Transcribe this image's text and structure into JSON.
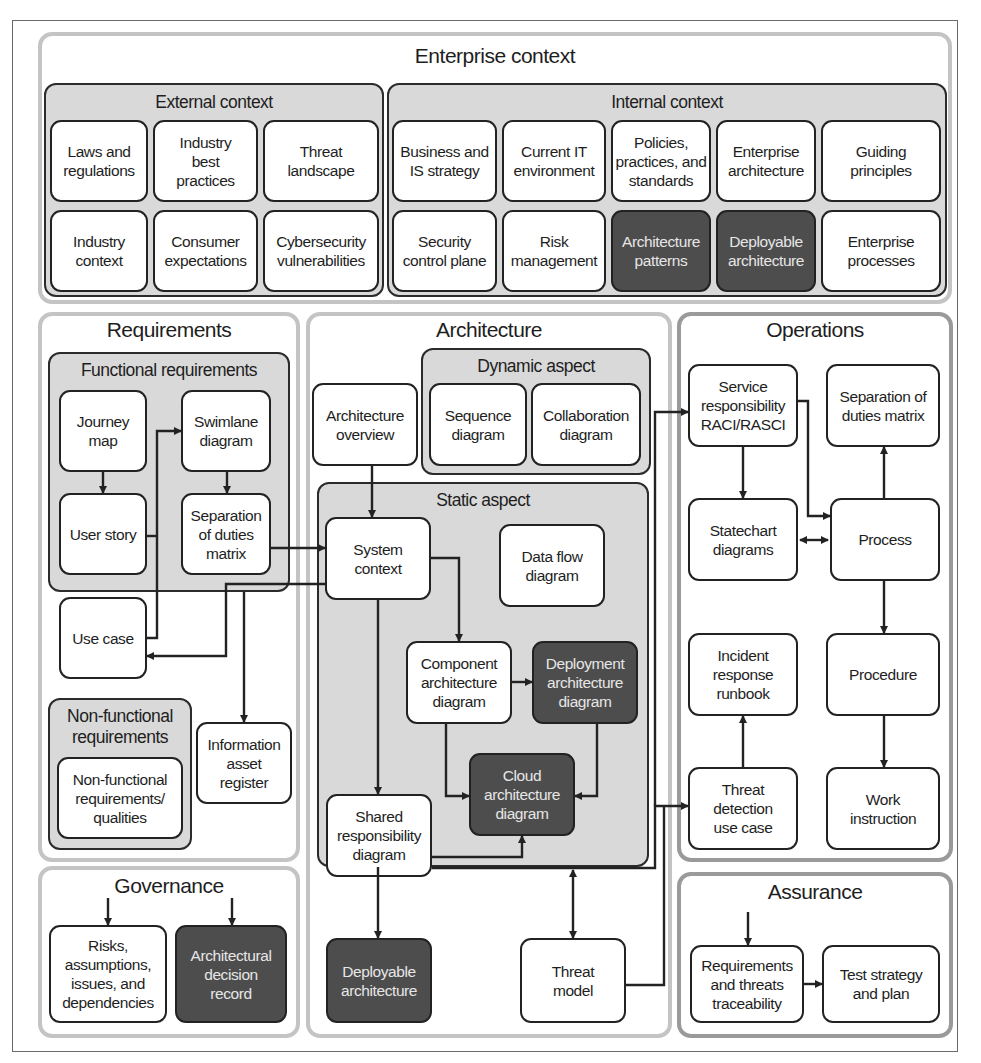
{
  "enterprise_context": {
    "title": "Enterprise context",
    "external": {
      "title": "External context",
      "items": [
        "Laws and\nregulations",
        "Industry\nbest\npractices",
        "Threat\nlandscape",
        "Industry\ncontext",
        "Consumer\nexpectations",
        "Cybersecurity\nvulnerabilities"
      ]
    },
    "internal": {
      "title": "Internal context",
      "items": [
        "Business and\nIS strategy",
        "Current IT\nenvironment",
        "Policies,\npractices, and\nstandards",
        "Enterprise\narchitecture",
        "Guiding\nprinciples",
        "Security\ncontrol plane",
        "Risk\nmanagement",
        "Architecture\npatterns",
        "Deployable\narchitecture",
        "Enterprise\nprocesses"
      ]
    }
  },
  "requirements": {
    "title": "Requirements",
    "functional": {
      "title": "Functional requirements",
      "journey_map": "Journey\nmap",
      "user_story": "User story",
      "use_case": "Use case",
      "swimlane": "Swimlane\ndiagram",
      "sod_matrix": "Separation\nof duties\nmatrix"
    },
    "non_functional": {
      "title": "Non-functional\nrequirements",
      "item": "Non-functional\nrequirements/\nqualities"
    },
    "info_asset_register": "Information\nasset\nregister"
  },
  "governance": {
    "title": "Governance",
    "raid": "Risks,\nassumptions,\nissues, and\ndependencies",
    "adr": "Architectural\ndecision\nrecord"
  },
  "architecture": {
    "title": "Architecture",
    "overview": "Architecture\noverview",
    "dynamic": {
      "title": "Dynamic aspect",
      "sequence": "Sequence\ndiagram",
      "collaboration": "Collaboration\ndiagram"
    },
    "static": {
      "title": "Static aspect",
      "system_context": "System\ncontext",
      "data_flow": "Data flow\ndiagram",
      "component": "Component\narchitecture\ndiagram",
      "deployment": "Deployment\narchitecture\ndiagram",
      "cloud": "Cloud\narchitecture\ndiagram",
      "shared_responsibility": "Shared\nresponsibility\ndiagram"
    },
    "deployable": "Deployable\narchitecture",
    "threat_model": "Threat\nmodel"
  },
  "operations": {
    "title": "Operations",
    "raci": "Service\nresponsibility\nRACI/RASCI",
    "sod_matrix": "Separation of\nduties matrix",
    "statechart": "Statechart\ndiagrams",
    "process": "Process",
    "incident_runbook": "Incident\nresponse\nrunbook",
    "procedure": "Procedure",
    "threat_detection": "Threat\ndetection\nuse case",
    "work_instruction": "Work\ninstruction"
  },
  "assurance": {
    "title": "Assurance",
    "traceability": "Requirements\nand threats\ntraceability",
    "test_strategy": "Test strategy\nand plan"
  },
  "colors": {
    "dark_box": "#4d4d4d",
    "group_fill": "#d9d9d9",
    "region_border": "#c4c4c4",
    "line": "#222222"
  }
}
